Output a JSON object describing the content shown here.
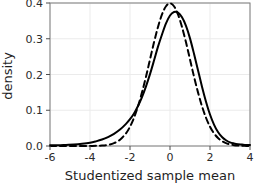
{
  "chart_data": {
    "type": "line",
    "title": "",
    "subtitle": "",
    "xlabel": "Studentized sample mean",
    "ylabel": "density",
    "xlim": [
      -6,
      4
    ],
    "ylim": [
      0.0,
      0.4
    ],
    "xticks": [
      -6,
      -4,
      -2,
      0,
      2,
      4
    ],
    "xtick_labels": [
      "-6",
      "-4",
      "-2",
      "0",
      "2",
      "4"
    ],
    "yticks": [
      0.0,
      0.1,
      0.2,
      0.3,
      0.4
    ],
    "ytick_labels": [
      "0.0",
      "0.1",
      "0.2",
      "0.3",
      "0.4"
    ],
    "grid": true,
    "grid_color": "#ebebeb",
    "panel_border_color": "#7d7d7d",
    "legend": "none",
    "annotations": [],
    "series": [
      {
        "name": "Studentized sample mean density",
        "style": "solid",
        "color": "#000000",
        "line_width": 2.0,
        "comment_shape": "left-skewed, heavier left tail, peak ~0.375 near x=0.2",
        "x": [
          -6.0,
          -5.6,
          -5.2,
          -4.8,
          -4.4,
          -4.0,
          -3.7,
          -3.4,
          -3.1,
          -2.8,
          -2.5,
          -2.2,
          -2.0,
          -1.8,
          -1.6,
          -1.4,
          -1.2,
          -1.0,
          -0.8,
          -0.6,
          -0.4,
          -0.2,
          0.0,
          0.2,
          0.4,
          0.6,
          0.8,
          1.0,
          1.2,
          1.4,
          1.6,
          1.8,
          2.0,
          2.2,
          2.4,
          2.6,
          2.8,
          3.0,
          3.2,
          3.4,
          3.6,
          3.8,
          4.0
        ],
        "y": [
          0.002,
          0.002,
          0.003,
          0.004,
          0.006,
          0.009,
          0.013,
          0.018,
          0.025,
          0.034,
          0.046,
          0.062,
          0.075,
          0.091,
          0.112,
          0.137,
          0.167,
          0.201,
          0.239,
          0.278,
          0.312,
          0.343,
          0.365,
          0.375,
          0.373,
          0.36,
          0.336,
          0.301,
          0.258,
          0.212,
          0.166,
          0.124,
          0.088,
          0.06,
          0.039,
          0.025,
          0.016,
          0.01,
          0.007,
          0.005,
          0.004,
          0.003,
          0.003
        ]
      },
      {
        "name": "Standard normal reference density",
        "style": "dashed",
        "color": "#000000",
        "line_width": 2.0,
        "dash_pattern": "6,4",
        "comment_shape": "symmetric normal, peak ~0.398 at x=0",
        "x": [
          -6.0,
          -5.6,
          -5.2,
          -4.8,
          -4.4,
          -4.0,
          -3.7,
          -3.4,
          -3.1,
          -2.8,
          -2.5,
          -2.2,
          -2.0,
          -1.8,
          -1.6,
          -1.4,
          -1.2,
          -1.0,
          -0.8,
          -0.6,
          -0.4,
          -0.2,
          0.0,
          0.2,
          0.4,
          0.6,
          0.8,
          1.0,
          1.2,
          1.4,
          1.6,
          1.8,
          2.0,
          2.2,
          2.4,
          2.6,
          2.8,
          3.0,
          3.2,
          3.4,
          3.6,
          3.8,
          4.0
        ],
        "y": [
          0.0,
          0.0,
          0.0,
          0.0,
          0.0,
          0.0002,
          0.0004,
          0.0012,
          0.0033,
          0.0079,
          0.0175,
          0.0355,
          0.054,
          0.079,
          0.111,
          0.15,
          0.194,
          0.242,
          0.29,
          0.333,
          0.368,
          0.391,
          0.399,
          0.391,
          0.368,
          0.333,
          0.29,
          0.242,
          0.194,
          0.15,
          0.111,
          0.079,
          0.054,
          0.0355,
          0.0224,
          0.0136,
          0.0079,
          0.0044,
          0.0024,
          0.0012,
          0.0006,
          0.0003,
          0.0001
        ]
      }
    ]
  },
  "figure": {
    "background_color": "#ffffff",
    "axis_label_x": "Studentized sample mean",
    "axis_label_y": "density"
  }
}
